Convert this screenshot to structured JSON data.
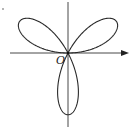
{
  "figure": {
    "type": "polar-rose-curve",
    "origin_label": "O",
    "petals": 3,
    "stroke_color": "#2a2a2a",
    "axis_color": "#333333",
    "background": "#ffffff"
  },
  "axes": {
    "x_axis": {
      "has_arrow": true,
      "direction": "right"
    },
    "y_axis": {
      "has_arrow": false
    }
  },
  "marker": {
    "text": "·"
  }
}
